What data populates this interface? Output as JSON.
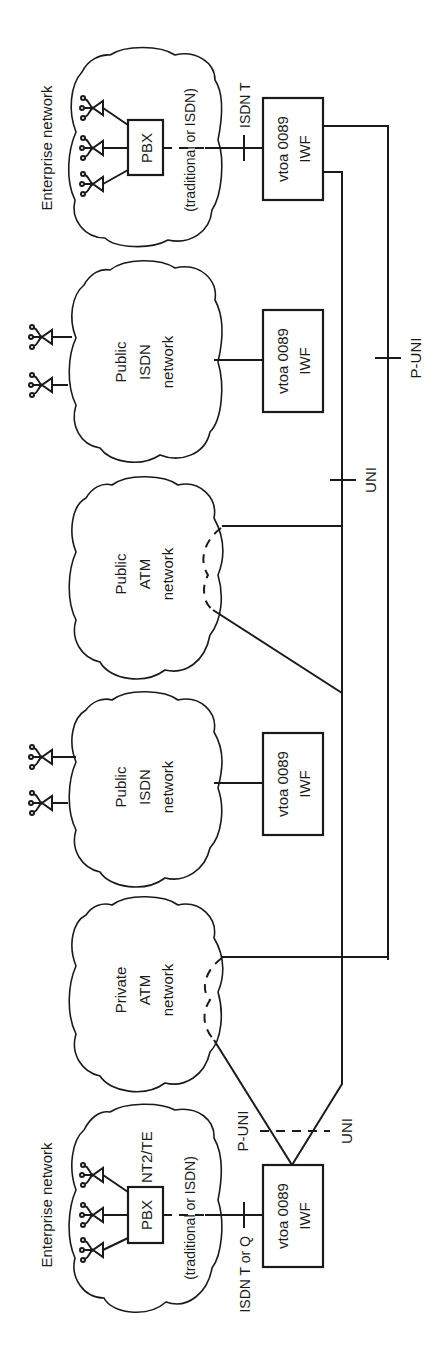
{
  "diagram": {
    "orientation": "rotated 90 degrees counter-clockwise",
    "nodes": {
      "enterprise_top": {
        "caption": "Enterprise network",
        "pbx": "PBX",
        "sublabel": "(traditional or ISDN)",
        "interface": "ISDN T"
      },
      "iwf_top": {
        "line1": "vtoa 0089",
        "line2": "IWF"
      },
      "public_isdn_1": {
        "line1": "Public",
        "line2": "ISDN",
        "line3": "network"
      },
      "iwf_isdn_1": {
        "line1": "vtoa 0089",
        "line2": "IWF"
      },
      "public_atm": {
        "line1": "Public",
        "line2": "ATM",
        "line3": "network"
      },
      "public_isdn_2": {
        "line1": "Public",
        "line2": "ISDN",
        "line3": "network"
      },
      "iwf_isdn_2": {
        "line1": "vtoa 0089",
        "line2": "IWF"
      },
      "private_atm": {
        "line1": "Private",
        "line2": "ATM",
        "line3": "network"
      },
      "enterprise_bottom": {
        "caption": "Enterprise network",
        "pbx": "PBX",
        "pbx_role": "NT2/TE",
        "sublabel": "(traditional or ISDN)",
        "interface": "ISDN T or Q"
      },
      "iwf_bottom": {
        "line1": "vtoa 0089",
        "line2": "IWF"
      }
    },
    "interfaces": {
      "uni_right": "UNI",
      "p_uni_right": "P-UNI",
      "p_uni_bottom": "P-UNI",
      "uni_bottom": "UNI"
    }
  }
}
